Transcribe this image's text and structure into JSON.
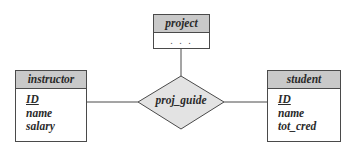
{
  "diagram": {
    "type": "ER diagram",
    "entities": {
      "project": {
        "name": "project",
        "attributes_placeholder": ". . ."
      },
      "instructor": {
        "name": "instructor",
        "attributes": [
          {
            "name": "ID",
            "primary_key": true
          },
          {
            "name": "name",
            "primary_key": false
          },
          {
            "name": "salary",
            "primary_key": false
          }
        ]
      },
      "student": {
        "name": "student",
        "attributes": [
          {
            "name": "ID",
            "primary_key": true
          },
          {
            "name": "name",
            "primary_key": false
          },
          {
            "name": "tot_cred",
            "primary_key": false
          }
        ]
      }
    },
    "relationship": {
      "name": "proj_guide",
      "connects": [
        "instructor",
        "project",
        "student"
      ]
    },
    "colors": {
      "header_fill": "#c9c9c9",
      "diamond_fill": "#e3e3e3",
      "line": "#4a4a4a",
      "text": "#2a2a2a"
    }
  }
}
